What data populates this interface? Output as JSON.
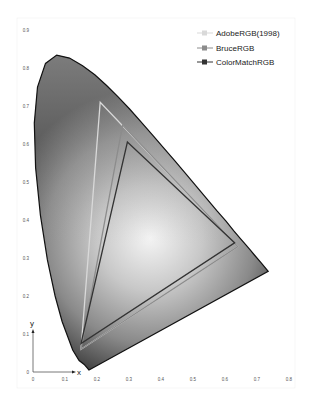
{
  "chart_data": {
    "type": "line",
    "title": "",
    "subtitle": "CIE 1931 xy chromaticity diagram with RGB working-space gamuts",
    "xlabel": "x",
    "ylabel": "y",
    "xlim": [
      0,
      0.8
    ],
    "ylim": [
      0,
      0.9
    ],
    "x_ticks": [
      "0",
      "0.1",
      "0.2",
      "0.3",
      "0.4",
      "0.5",
      "0.6",
      "0.7",
      "0.8"
    ],
    "y_ticks": [
      "0",
      "0.1",
      "0.2",
      "0.3",
      "0.4",
      "0.5",
      "0.6",
      "0.7",
      "0.8",
      "0.9"
    ],
    "grid": false,
    "legend_position": "top-right",
    "series": [
      {
        "name": "AdobeRGB(1998)",
        "color": "#d9d9d9",
        "points": [
          [
            0.64,
            0.33
          ],
          [
            0.21,
            0.71
          ],
          [
            0.15,
            0.06
          ]
        ]
      },
      {
        "name": "BruceRGB",
        "color": "#8c8c8c",
        "points": [
          [
            0.64,
            0.33
          ],
          [
            0.28,
            0.65
          ],
          [
            0.15,
            0.06
          ]
        ]
      },
      {
        "name": "ColorMatchRGB",
        "color": "#333333",
        "points": [
          [
            0.63,
            0.34
          ],
          [
            0.295,
            0.605
          ],
          [
            0.15,
            0.075
          ]
        ]
      }
    ],
    "spectral_locus": [
      [
        0.175,
        0.005
      ],
      [
        0.17,
        0.01
      ],
      [
        0.16,
        0.02
      ],
      [
        0.144,
        0.03
      ],
      [
        0.124,
        0.058
      ],
      [
        0.091,
        0.133
      ],
      [
        0.069,
        0.2
      ],
      [
        0.045,
        0.295
      ],
      [
        0.023,
        0.413
      ],
      [
        0.008,
        0.538
      ],
      [
        0.004,
        0.655
      ],
      [
        0.014,
        0.75
      ],
      [
        0.039,
        0.812
      ],
      [
        0.074,
        0.834
      ],
      [
        0.114,
        0.826
      ],
      [
        0.155,
        0.806
      ],
      [
        0.193,
        0.782
      ],
      [
        0.23,
        0.754
      ],
      [
        0.266,
        0.724
      ],
      [
        0.302,
        0.692
      ],
      [
        0.337,
        0.659
      ],
      [
        0.373,
        0.624
      ],
      [
        0.408,
        0.59
      ],
      [
        0.444,
        0.555
      ],
      [
        0.479,
        0.52
      ],
      [
        0.512,
        0.487
      ],
      [
        0.544,
        0.455
      ],
      [
        0.575,
        0.424
      ],
      [
        0.603,
        0.397
      ],
      [
        0.627,
        0.372
      ],
      [
        0.648,
        0.351
      ],
      [
        0.666,
        0.334
      ],
      [
        0.68,
        0.32
      ],
      [
        0.692,
        0.308
      ],
      [
        0.713,
        0.287
      ],
      [
        0.735,
        0.265
      ]
    ]
  },
  "legend": {
    "items": [
      {
        "label": "AdobeRGB(1998)",
        "color": "#d9d9d9"
      },
      {
        "label": "BruceRGB",
        "color": "#8c8c8c"
      },
      {
        "label": "ColorMatchRGB",
        "color": "#333333"
      }
    ]
  },
  "axes": {
    "x_label": "x",
    "y_label": "y"
  }
}
